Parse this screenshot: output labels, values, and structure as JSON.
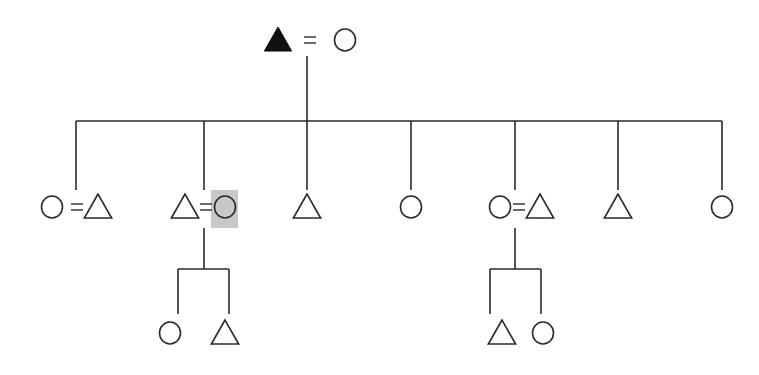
{
  "diagram": {
    "type": "kinship-chart",
    "colors": {
      "line": "#2a2a2a",
      "filled_symbol": "#111111",
      "highlight": "#c8c8c8",
      "background": "#ffffff"
    },
    "legend_symbols": {
      "triangle": "male",
      "circle": "female",
      "filled": "ego/deceased marker",
      "equals": "marriage"
    },
    "parents": {
      "left": {
        "shape": "triangle",
        "filled": true,
        "x": 278,
        "y": 40
      },
      "right": {
        "shape": "circle",
        "filled": false,
        "x": 345,
        "y": 40
      },
      "marriage_x": 310
    },
    "sibling_bar": {
      "y": 121,
      "x1": 76,
      "x2": 722,
      "descent_x": 307,
      "descent_y1": 56
    },
    "generation2": [
      {
        "drop_x": 76,
        "items": [
          {
            "shape": "circle",
            "x": 52
          },
          {
            "shape": "triangle",
            "x": 98
          }
        ],
        "marriage": true,
        "eq_x": 77
      },
      {
        "drop_x": 204,
        "items": [
          {
            "shape": "triangle",
            "x": 185
          },
          {
            "shape": "circle",
            "x": 225,
            "highlighted": true
          }
        ],
        "marriage": true,
        "eq_x": 206,
        "children_key": "left_children"
      },
      {
        "drop_x": 307,
        "items": [
          {
            "shape": "triangle",
            "x": 307
          }
        ]
      },
      {
        "drop_x": 411,
        "items": [
          {
            "shape": "circle",
            "x": 411
          }
        ]
      },
      {
        "drop_x": 515,
        "items": [
          {
            "shape": "circle",
            "x": 500
          },
          {
            "shape": "triangle",
            "x": 540
          }
        ],
        "marriage": true,
        "eq_x": 519,
        "children_key": "right_children"
      },
      {
        "drop_x": 618,
        "items": [
          {
            "shape": "triangle",
            "x": 618
          }
        ]
      },
      {
        "drop_x": 722,
        "items": [
          {
            "shape": "circle",
            "x": 722
          }
        ]
      }
    ],
    "left_children": {
      "descent_x": 204,
      "bar_y": 269,
      "x1": 178,
      "x2": 229,
      "items": [
        {
          "shape": "circle",
          "x": 170
        },
        {
          "shape": "triangle",
          "x": 225
        }
      ]
    },
    "right_children": {
      "descent_x": 515,
      "bar_y": 269,
      "x1": 490,
      "x2": 541,
      "items": [
        {
          "shape": "triangle",
          "x": 502
        },
        {
          "shape": "circle",
          "x": 543
        }
      ]
    },
    "highlight_box": {
      "x": 211,
      "y": 190,
      "w": 27,
      "h": 38
    }
  }
}
